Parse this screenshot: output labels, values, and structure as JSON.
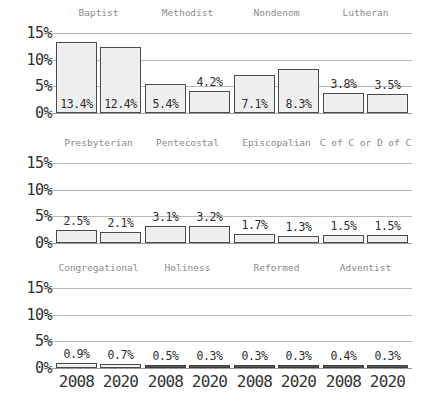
{
  "chart_data": {
    "type": "bar",
    "title": "",
    "subtitle": "",
    "xlabel": "",
    "ylabel": "",
    "ylim": [
      0,
      15
    ],
    "grid": true,
    "legend": "none",
    "layout": "small-multiples 4 columns x 3 rows",
    "categories": [
      "2008",
      "2020"
    ],
    "y_ticks": [
      "0%",
      "5%",
      "10%",
      "15%"
    ],
    "y_tick_values": [
      0,
      5,
      10,
      15
    ],
    "panels": [
      {
        "name": "Baptist",
        "values": [
          13.4,
          12.4
        ],
        "labels": [
          "13.4%",
          "12.4%"
        ]
      },
      {
        "name": "Methodist",
        "values": [
          5.4,
          4.2
        ],
        "labels": [
          "5.4%",
          "4.2%"
        ]
      },
      {
        "name": "Nondenom",
        "values": [
          7.1,
          8.3
        ],
        "labels": [
          "7.1%",
          "8.3%"
        ]
      },
      {
        "name": "Lutheran",
        "values": [
          3.8,
          3.5
        ],
        "labels": [
          "3.8%",
          "3.5%"
        ]
      },
      {
        "name": "Presbyterian",
        "values": [
          2.5,
          2.1
        ],
        "labels": [
          "2.5%",
          "2.1%"
        ]
      },
      {
        "name": "Pentecostal",
        "values": [
          3.1,
          3.2
        ],
        "labels": [
          "3.1%",
          "3.2%"
        ]
      },
      {
        "name": "Episcopalian",
        "values": [
          1.7,
          1.3
        ],
        "labels": [
          "1.7%",
          "1.3%"
        ]
      },
      {
        "name": "C of C or D of C",
        "values": [
          1.5,
          1.5
        ],
        "labels": [
          "1.5%",
          "1.5%"
        ]
      },
      {
        "name": "Congregational",
        "values": [
          0.9,
          0.7
        ],
        "labels": [
          "0.9%",
          "0.7%"
        ]
      },
      {
        "name": "Holiness",
        "values": [
          0.5,
          0.3
        ],
        "labels": [
          "0.5%",
          "0.3%"
        ]
      },
      {
        "name": "Reformed",
        "values": [
          0.3,
          0.3
        ],
        "labels": [
          "0.3%",
          "0.3%"
        ]
      },
      {
        "name": "Adventist",
        "values": [
          0.4,
          0.3
        ],
        "labels": [
          "0.4%",
          "0.3%"
        ]
      }
    ],
    "colors": {
      "bar_fill": "#efefef",
      "bar_stroke": "#4a4a4a",
      "gridline": "#b9b9b9",
      "baseline": "#9a9a9a",
      "title_text": "#8a8a8a",
      "tick_text": "#333333",
      "background": "#ffffff"
    }
  }
}
